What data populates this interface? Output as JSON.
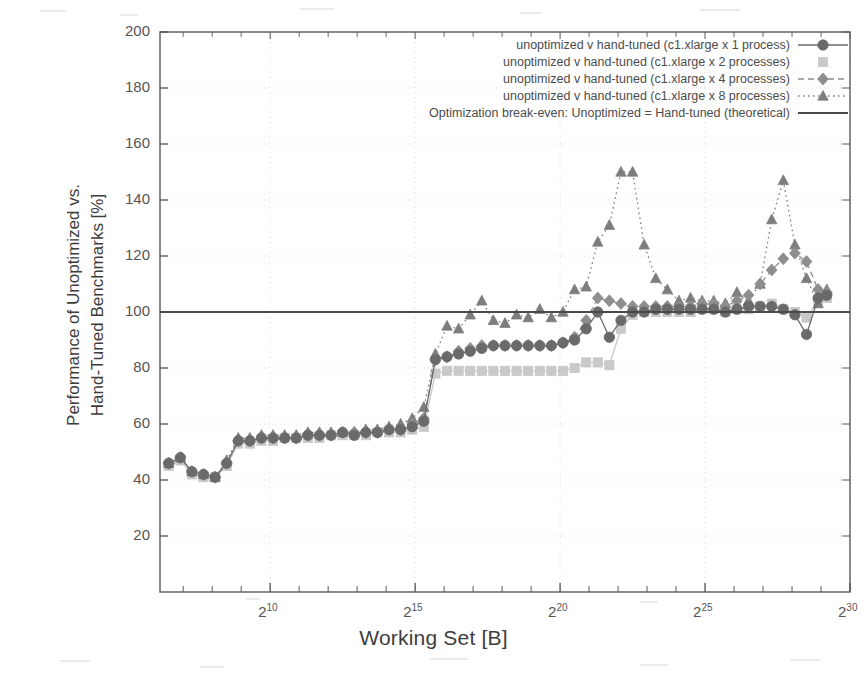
{
  "figure": {
    "xlabel": "Working Set [B]",
    "ylabel_line1": "Performance of Unoptimized vs.",
    "ylabel_line2": "Hand-Tuned Benchmarks [%]"
  },
  "legend": {
    "entries": [
      {
        "label": "unoptimized v hand-tuned (c1.xlarge x 1 process)",
        "key": "circle-solid-key"
      },
      {
        "label": "unoptimized v hand-tuned (c1.xlarge x 2 processes)",
        "key": "square-key"
      },
      {
        "label": "unoptimized v hand-tuned (c1.xlarge x 4 processes)",
        "key": "diamond-dashed-key"
      },
      {
        "label": "unoptimized v hand-tuned (c1.xlarge x 8 processes)",
        "key": "triangle-dotted-key"
      },
      {
        "label": "Optimization break-even: Unoptimized = Hand-tuned (theoretical)",
        "key": "solid-line-key"
      }
    ]
  },
  "axes": {
    "y_ticks": [
      "200",
      "180",
      "160",
      "140",
      "120",
      "100",
      "80",
      "60",
      "40",
      "20"
    ],
    "y_tick_values": [
      200,
      180,
      160,
      140,
      120,
      100,
      80,
      60,
      40,
      20
    ],
    "x_ticks": [
      {
        "base": "2",
        "exp": "10",
        "value": 10
      },
      {
        "base": "2",
        "exp": "15",
        "value": 15
      },
      {
        "base": "2",
        "exp": "20",
        "value": 20
      },
      {
        "base": "2",
        "exp": "25",
        "value": 25
      },
      {
        "base": "2",
        "exp": "30",
        "value": 30
      }
    ],
    "x_minor_values": [
      7,
      8,
      9,
      11,
      12,
      13,
      14,
      16,
      17,
      18,
      19,
      21,
      22,
      23,
      24,
      26,
      27,
      28,
      29
    ]
  },
  "colors": {
    "series_1_process": "#6b6b6b",
    "series_2_processes": "#c9c9c9",
    "series_4_processes": "#8e8e8e",
    "series_8_processes": "#7d7d7d",
    "breakeven_line": "#4a4a4a",
    "axis": "#5a5a5a",
    "grid": "#d9d9d9",
    "background": "#ffffff"
  },
  "chart_data": {
    "type": "line",
    "title": "",
    "xlabel": "Working Set [B]",
    "ylabel": "Performance of Unoptimized vs. Hand-Tuned Benchmarks [%]",
    "xscale": "log2",
    "xlim": [
      6.2,
      30.0
    ],
    "ylim": [
      0,
      200
    ],
    "yticks": [
      20,
      40,
      60,
      80,
      100,
      120,
      140,
      160,
      180,
      200
    ],
    "xticks": [
      10,
      15,
      20,
      25,
      30
    ],
    "xtick_labels": [
      "2^10",
      "2^15",
      "2^20",
      "2^25",
      "2^30"
    ],
    "grid": true,
    "legend_position": "upper right",
    "annotations": [
      "Break-even horizontal reference line drawn at y = 100%"
    ],
    "reference_lines": [
      {
        "orientation": "horizontal",
        "y": 100,
        "label": "Optimization break-even: Unoptimized = Hand-tuned (theoretical)"
      }
    ],
    "x": [
      6.5,
      6.9,
      7.3,
      7.7,
      8.1,
      8.5,
      8.9,
      9.3,
      9.7,
      10.1,
      10.5,
      10.9,
      11.3,
      11.7,
      12.1,
      12.5,
      12.9,
      13.3,
      13.7,
      14.1,
      14.5,
      14.9,
      15.3,
      15.7,
      16.1,
      16.5,
      16.9,
      17.3,
      17.7,
      18.1,
      18.5,
      18.9,
      19.3,
      19.7,
      20.1,
      20.5,
      20.9,
      21.3,
      21.7,
      22.1,
      22.5,
      22.9,
      23.3,
      23.7,
      24.1,
      24.5,
      24.9,
      25.3,
      25.7,
      26.1,
      26.5,
      26.9,
      27.3,
      27.7,
      28.1,
      28.5,
      28.9,
      29.2
    ],
    "series": [
      {
        "name": "unoptimized v hand-tuned (c1.xlarge x 1 process)",
        "marker": "circle",
        "linestyle": "solid",
        "color": "#6b6b6b",
        "values": [
          46,
          48,
          43,
          42,
          41,
          46,
          54,
          54,
          55,
          55,
          55,
          55,
          56,
          56,
          56,
          57,
          56,
          57,
          57,
          58,
          58,
          59,
          61,
          83,
          84,
          85,
          86,
          87,
          88,
          88,
          88,
          88,
          88,
          88,
          89,
          90,
          94,
          100,
          91,
          97,
          100,
          100,
          101,
          101,
          101,
          101,
          101,
          101,
          100,
          101,
          102,
          102,
          102,
          101,
          99,
          92,
          105,
          106
        ]
      },
      {
        "name": "unoptimized v hand-tuned (c1.xlarge x 2 processes)",
        "marker": "square",
        "linestyle": "solid",
        "color": "#c9c9c9",
        "values": [
          45,
          47,
          42,
          41,
          41,
          45,
          53,
          53,
          54,
          54,
          55,
          55,
          55,
          55,
          56,
          56,
          56,
          56,
          57,
          57,
          57,
          58,
          59,
          78,
          79,
          79,
          79,
          79,
          79,
          79,
          79,
          79,
          79,
          79,
          79,
          80,
          82,
          82,
          81,
          94,
          99,
          100,
          100,
          100,
          100,
          100,
          101,
          101,
          100,
          101,
          101,
          102,
          103,
          101,
          100,
          98,
          104,
          105
        ]
      },
      {
        "name": "unoptimized v hand-tuned (c1.xlarge x 4 processes)",
        "marker": "diamond",
        "linestyle": "dashed",
        "color": "#8e8e8e",
        "values": [
          46,
          48,
          43,
          42,
          41,
          46,
          54,
          54,
          55,
          55,
          55,
          55,
          56,
          56,
          56,
          57,
          57,
          57,
          57,
          58,
          58,
          60,
          62,
          83,
          84,
          86,
          87,
          88,
          88,
          88,
          88,
          88,
          88,
          88,
          89,
          91,
          97,
          105,
          104,
          103,
          102,
          102,
          102,
          102,
          102,
          102,
          103,
          103,
          102,
          104,
          106,
          110,
          115,
          119,
          121,
          118,
          108,
          107
        ]
      },
      {
        "name": "unoptimized v hand-tuned (c1.xlarge x 8 processes)",
        "marker": "triangle",
        "linestyle": "dotted",
        "color": "#7d7d7d",
        "values": [
          46,
          48,
          43,
          42,
          41,
          47,
          55,
          55,
          56,
          56,
          56,
          56,
          57,
          57,
          57,
          57,
          57,
          58,
          58,
          59,
          60,
          62,
          66,
          85,
          95,
          94,
          99,
          104,
          97,
          96,
          99,
          98,
          101,
          98,
          100,
          108,
          109,
          125,
          131,
          150,
          150,
          124,
          112,
          108,
          104,
          105,
          104,
          104,
          103,
          107,
          104,
          110,
          133,
          147,
          124,
          112,
          103,
          108
        ]
      }
    ]
  }
}
